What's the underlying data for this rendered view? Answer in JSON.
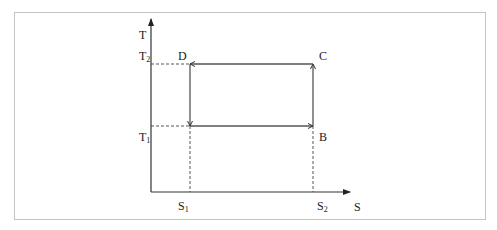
{
  "diagram": {
    "type": "T-S diagram (Carnot cycle)",
    "axes": {
      "y_label": "T",
      "x_label": "S"
    },
    "levels": {
      "T_high": {
        "base": "T",
        "sub": "2"
      },
      "T_low": {
        "base": "T",
        "sub": "1"
      },
      "S_low": {
        "base": "S",
        "sub": "1"
      },
      "S_high": {
        "base": "S",
        "sub": "2"
      }
    },
    "points": {
      "B": "B",
      "C": "C",
      "D": "D"
    },
    "cycle_edges": [
      {
        "from": "A",
        "to": "B",
        "direction": "right"
      },
      {
        "from": "B",
        "to": "C",
        "direction": "up"
      },
      {
        "from": "C",
        "to": "D",
        "direction": "left"
      },
      {
        "from": "D",
        "to": "A",
        "direction": "down"
      }
    ]
  }
}
